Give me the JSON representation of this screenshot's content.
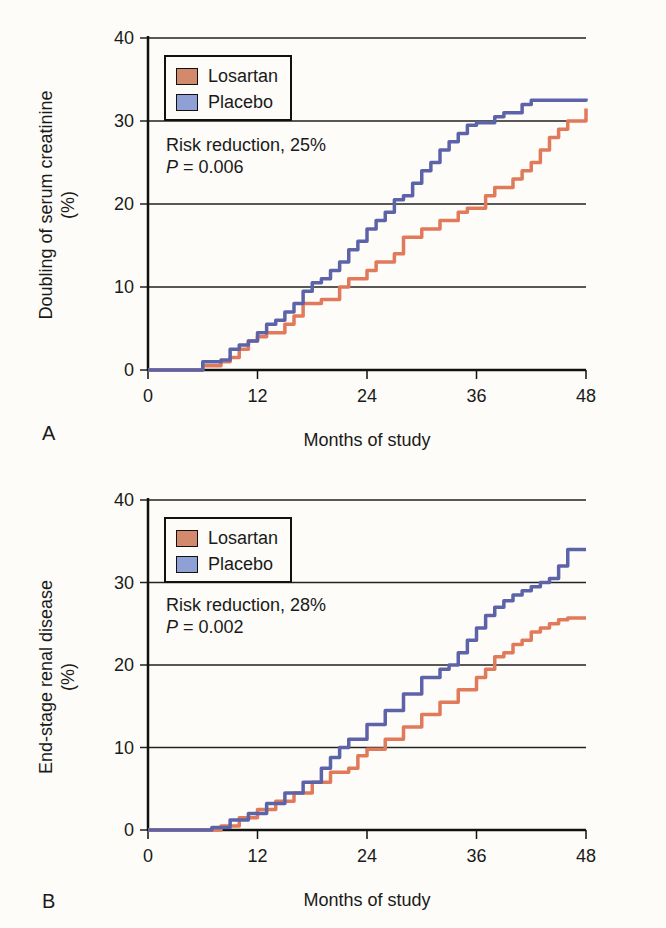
{
  "chart_data": [
    {
      "type": "line",
      "panel": "A",
      "title": "",
      "xlabel": "Months of study",
      "ylabel": "Doubling of serum creatinine (%)",
      "ylabel_line1": "Doubling of serum creatinine",
      "ylabel_line2": "(%)",
      "xlim": [
        0,
        48
      ],
      "ylim": [
        0,
        40
      ],
      "xticks": [
        "0",
        "12",
        "24",
        "36",
        "48"
      ],
      "yticks": [
        "0",
        "10",
        "20",
        "30",
        "40"
      ],
      "grid": "horizontal",
      "legend": [
        "Losartan",
        "Placebo"
      ],
      "legend_position": "upper left",
      "annotation_line1": "Risk reduction, 25%",
      "annotation_p_label": "P",
      "annotation_p_value": " = 0.006",
      "series": [
        {
          "name": "Losartan",
          "color": "#e07a5a",
          "x": [
            0,
            5,
            6,
            8,
            9,
            10,
            11,
            12,
            13,
            15,
            16,
            17,
            19,
            21,
            22,
            24,
            25,
            27,
            28,
            30,
            32,
            34,
            35,
            37,
            38,
            40,
            41,
            42,
            43,
            44,
            45,
            46,
            47.5,
            48
          ],
          "y": [
            0,
            0,
            0.5,
            1,
            1.5,
            2.5,
            3.5,
            4,
            4.5,
            5.5,
            6.5,
            8,
            8.5,
            10,
            11,
            12,
            13,
            14,
            16,
            17,
            18,
            19,
            19.5,
            21,
            22,
            23,
            24,
            25,
            26.5,
            28,
            29,
            30,
            30,
            31.5
          ]
        },
        {
          "name": "Placebo",
          "color": "#5d63a8",
          "x": [
            0,
            5,
            6,
            8,
            9,
            10,
            11,
            12,
            13,
            14,
            15,
            16,
            17,
            18,
            19,
            20,
            21,
            22,
            23,
            24,
            25,
            26,
            27,
            28,
            29,
            30,
            31,
            32,
            33,
            34,
            35,
            36,
            38,
            39,
            41,
            42,
            48
          ],
          "y": [
            0,
            0,
            1,
            1.2,
            2.5,
            3,
            3.5,
            4.5,
            5.5,
            6,
            7,
            8,
            9.5,
            10.5,
            11,
            12,
            13,
            14.5,
            15.5,
            17,
            18,
            19,
            20.5,
            21,
            22.5,
            24,
            25,
            26.5,
            27.5,
            28.5,
            29.5,
            29.8,
            30.5,
            31,
            32,
            32.5,
            32.7
          ]
        }
      ]
    },
    {
      "type": "line",
      "panel": "B",
      "title": "",
      "xlabel": "Months of study",
      "ylabel": "End-stage renal disease (%)",
      "ylabel_line1": "End-stage renal disease",
      "ylabel_line2": "(%)",
      "xlim": [
        0,
        48
      ],
      "ylim": [
        0,
        40
      ],
      "xticks": [
        "0",
        "12",
        "24",
        "36",
        "48"
      ],
      "yticks": [
        "0",
        "10",
        "20",
        "30",
        "40"
      ],
      "grid": "horizontal",
      "legend": [
        "Losartan",
        "Placebo"
      ],
      "legend_position": "upper left",
      "annotation_line1": "Risk reduction, 28%",
      "annotation_p_label": "P",
      "annotation_p_value": " = 0.002",
      "series": [
        {
          "name": "Losartan",
          "color": "#e07a5a",
          "x": [
            0,
            6,
            8,
            10,
            12,
            14,
            16,
            18,
            20,
            22,
            23,
            24,
            26,
            28,
            30,
            32,
            34,
            36,
            37,
            38,
            39,
            40,
            41,
            42,
            43,
            44,
            45,
            46,
            48
          ],
          "y": [
            0,
            0,
            0.5,
            1.5,
            2.5,
            3.5,
            4.5,
            5.8,
            7,
            7.5,
            9,
            9.8,
            11,
            12.5,
            14,
            15.5,
            17,
            18.5,
            19.5,
            21,
            21.5,
            22.5,
            23,
            24,
            24.5,
            25,
            25.5,
            25.7,
            25.7
          ]
        },
        {
          "name": "Placebo",
          "color": "#5d63a8",
          "x": [
            0,
            5,
            7,
            9,
            11,
            13,
            15,
            17,
            19,
            20,
            21,
            22,
            24,
            26,
            28,
            30,
            32,
            33,
            34,
            35,
            36,
            37,
            38,
            39,
            40,
            41,
            42,
            43,
            44,
            45,
            46,
            48
          ],
          "y": [
            0,
            0,
            0.3,
            1.2,
            2,
            3.2,
            4.5,
            5.8,
            7.5,
            8.8,
            10,
            11,
            12.8,
            14.5,
            16.5,
            18.5,
            19.5,
            20,
            21.5,
            23,
            24.5,
            26,
            27,
            27.8,
            28.5,
            29,
            29.5,
            30,
            30.5,
            32,
            34,
            34
          ]
        }
      ]
    }
  ],
  "panels": [
    {
      "letter": "A"
    },
    {
      "letter": "B"
    }
  ],
  "colors": {
    "losartan": "#e07a5a",
    "losartan_swatch": "#d38a6c",
    "placebo": "#5d63a8",
    "placebo_swatch": "#8ea0d4",
    "axis": "#111111",
    "background": "#fdfcf8"
  }
}
